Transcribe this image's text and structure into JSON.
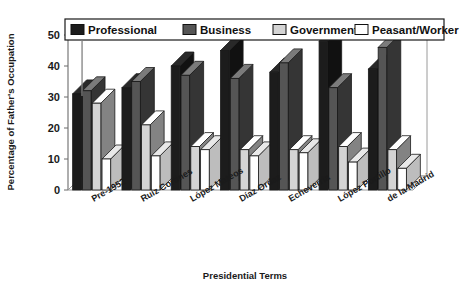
{
  "chart_data": {
    "type": "bar",
    "title": "",
    "xlabel": "Presidential Terms",
    "ylabel": "Percentage of Father's Occupation",
    "categories": [
      "Pre-1952",
      "Ruiz Cortines",
      "López Mateos",
      "Díaz Ordaz",
      "Echeverria",
      "López Portillo",
      "de la Madrid"
    ],
    "ylim": [
      0,
      50
    ],
    "yticks": [
      0,
      10,
      20,
      30,
      40,
      50
    ],
    "ytick_labels": [
      "0",
      "10",
      "20",
      "30",
      "40",
      "50"
    ],
    "grid": false,
    "legend_position": "top",
    "projection": "3d",
    "series": [
      {
        "name": "Professional",
        "color": "#1c1c1c",
        "values": [
          31,
          33,
          40,
          45,
          38,
          48,
          39
        ]
      },
      {
        "name": "Business",
        "color": "#555555",
        "values": [
          32,
          35,
          37,
          36,
          41,
          33,
          46
        ]
      },
      {
        "name": "Government",
        "color": "#d4d4d4",
        "values": [
          28,
          21,
          14,
          13,
          13,
          14,
          13
        ]
      },
      {
        "name": "Peasant/Worker",
        "color": "#ffffff",
        "values": [
          10,
          11,
          13,
          11,
          12,
          9,
          7
        ]
      }
    ]
  },
  "legend": {
    "items": [
      {
        "label": "Professional"
      },
      {
        "label": "Business"
      },
      {
        "label": "Government"
      },
      {
        "label": "Peasant/Worker"
      }
    ]
  }
}
